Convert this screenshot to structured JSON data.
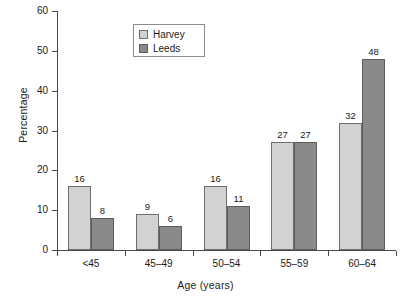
{
  "chart_data": {
    "type": "bar",
    "title": "",
    "subtitle": "",
    "xlabel": "Age (years)",
    "ylabel": "Percentage",
    "categories": [
      "<45",
      "45–49",
      "50–54",
      "55–59",
      "60–64"
    ],
    "series": [
      {
        "name": "Harvey",
        "color": "#d2d2d2",
        "values": [
          16,
          9,
          16,
          27,
          32
        ]
      },
      {
        "name": "Leeds",
        "color": "#8a8a8a",
        "values": [
          8,
          6,
          11,
          27,
          48
        ]
      }
    ],
    "ylim": [
      0,
      60
    ],
    "yticks": [
      0,
      10,
      20,
      30,
      40,
      50,
      60
    ],
    "ytick_labels": [
      "0",
      "10",
      "20",
      "30",
      "40",
      "50",
      "60"
    ],
    "grid": false,
    "legend_position": "upper-center",
    "data_labels": true,
    "data_label_values": [
      [
        "16",
        "8"
      ],
      [
        "9",
        "6"
      ],
      [
        "16",
        "11"
      ],
      [
        "27",
        "27"
      ],
      [
        "32",
        "48"
      ]
    ]
  },
  "legend": {
    "items": [
      {
        "label": "Harvey",
        "color": "#d2d2d2"
      },
      {
        "label": "Leeds",
        "color": "#8a8a8a"
      }
    ]
  },
  "colors": {
    "series_harvey": "#d2d2d2",
    "series_leeds": "#8a8a8a",
    "axis": "#4a4a4a",
    "text": "#1a1a1a",
    "background": "#ffffff"
  }
}
